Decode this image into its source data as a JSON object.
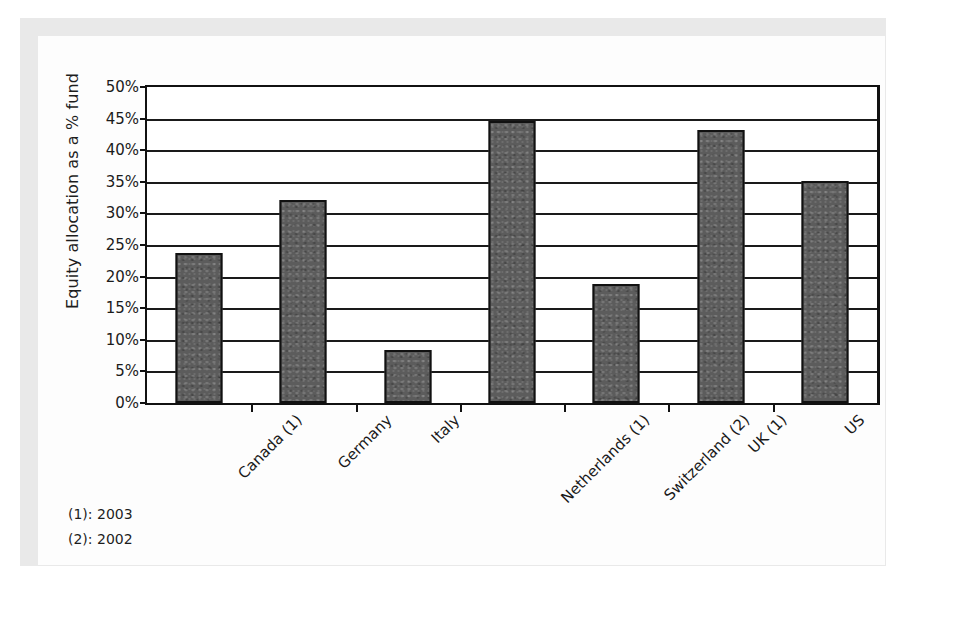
{
  "figure": {
    "background_color": "#e9e9e9",
    "paper_color": "#fdfdfd",
    "bar_color": "#5c5c5c",
    "axis_color": "#111111"
  },
  "chart_data": {
    "type": "bar",
    "title": "",
    "xlabel": "",
    "ylabel": "Equity allocation as a % fund",
    "categories": [
      "Canada (1)",
      "Germany",
      "Italy",
      "Netherlands (1)",
      "Switzerland (2)",
      "UK (1)",
      "US"
    ],
    "values": [
      23.7,
      32.2,
      8.4,
      44.6,
      18.9,
      43.2,
      35.2
    ],
    "ylim": [
      0,
      50
    ],
    "ytick_step": 5,
    "ytick_labels": [
      "0%",
      "5%",
      "10%",
      "15%",
      "20%",
      "25%",
      "30%",
      "35%",
      "40%",
      "45%",
      "50%"
    ],
    "ytick_values": [
      0,
      5,
      10,
      15,
      20,
      25,
      30,
      35,
      40,
      45,
      50
    ],
    "grid": "horizontal",
    "legend": "none",
    "value_suffix": "%"
  },
  "footnotes": [
    "(1): 2003",
    "(2): 2002"
  ]
}
